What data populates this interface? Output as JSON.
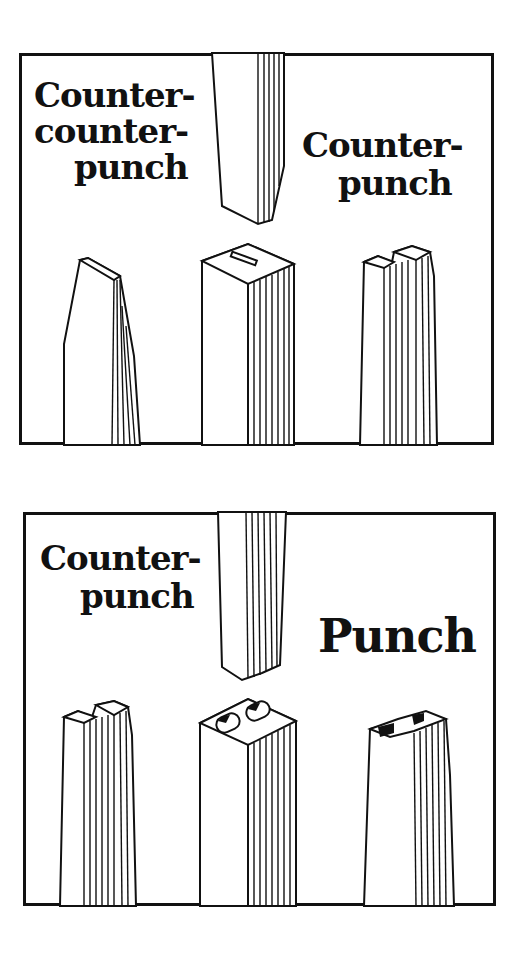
{
  "panels": [
    {
      "id": "top",
      "labels": {
        "left": [
          "Counter-",
          "counter-",
          "punch"
        ],
        "right": [
          "Counter-",
          "punch"
        ]
      },
      "objects": [
        "counter-counterpunch",
        "striking-punch-above",
        "counterpunch-with-slot",
        "counterpunch-stepped"
      ]
    },
    {
      "id": "bottom",
      "labels": {
        "left": [
          "Counter-",
          "punch"
        ],
        "right": [
          "Punch"
        ]
      },
      "objects": [
        "striking-punch-above",
        "counterpunch-stepped",
        "punch-B",
        "punch-H"
      ]
    }
  ],
  "colors": {
    "ink": "#111111",
    "paper": "#ffffff"
  }
}
